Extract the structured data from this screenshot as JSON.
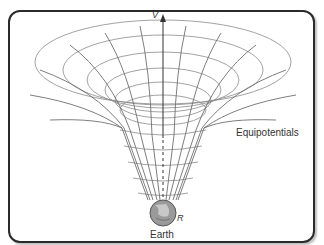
{
  "diagram": {
    "axis_label": "V",
    "labels": {
      "equipotentials": "Equipotentials",
      "radius": "R",
      "earth": "Earth"
    },
    "colors": {
      "grid_lines": "#8a8a8a",
      "axis": "#333333",
      "frame": "#2a2a2a",
      "earth": "#8c8c8c"
    }
  }
}
